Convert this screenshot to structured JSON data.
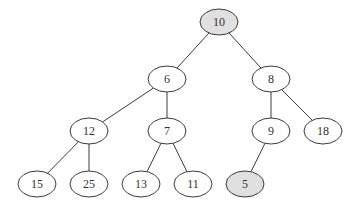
{
  "diagram": {
    "type": "binary-tree",
    "colors": {
      "highlight_fill": "#e0e0e0",
      "default_fill": "#ffffff",
      "stroke": "#3a3a3a"
    },
    "nodes": [
      {
        "id": "n10",
        "label": "10",
        "x": 219,
        "y": 22,
        "highlighted": true
      },
      {
        "id": "n6",
        "label": "6",
        "x": 167,
        "y": 79,
        "highlighted": false
      },
      {
        "id": "n8",
        "label": "8",
        "x": 271,
        "y": 79,
        "highlighted": false
      },
      {
        "id": "n12",
        "label": "12",
        "x": 89,
        "y": 131,
        "highlighted": false
      },
      {
        "id": "n7",
        "label": "7",
        "x": 167,
        "y": 131,
        "highlighted": false
      },
      {
        "id": "n9",
        "label": "9",
        "x": 271,
        "y": 131,
        "highlighted": false
      },
      {
        "id": "n18",
        "label": "18",
        "x": 323,
        "y": 131,
        "highlighted": false
      },
      {
        "id": "n15",
        "label": "15",
        "x": 37,
        "y": 184,
        "highlighted": false
      },
      {
        "id": "n25",
        "label": "25",
        "x": 89,
        "y": 184,
        "highlighted": false
      },
      {
        "id": "n13",
        "label": "13",
        "x": 141,
        "y": 184,
        "highlighted": false
      },
      {
        "id": "n11",
        "label": "11",
        "x": 193,
        "y": 184,
        "highlighted": false
      },
      {
        "id": "n5",
        "label": "5",
        "x": 245,
        "y": 184,
        "highlighted": true
      }
    ],
    "edges": [
      [
        "n10",
        "n6"
      ],
      [
        "n10",
        "n8"
      ],
      [
        "n6",
        "n12"
      ],
      [
        "n6",
        "n7"
      ],
      [
        "n8",
        "n9"
      ],
      [
        "n8",
        "n18"
      ],
      [
        "n12",
        "n15"
      ],
      [
        "n12",
        "n25"
      ],
      [
        "n7",
        "n13"
      ],
      [
        "n7",
        "n11"
      ],
      [
        "n9",
        "n5"
      ]
    ]
  }
}
